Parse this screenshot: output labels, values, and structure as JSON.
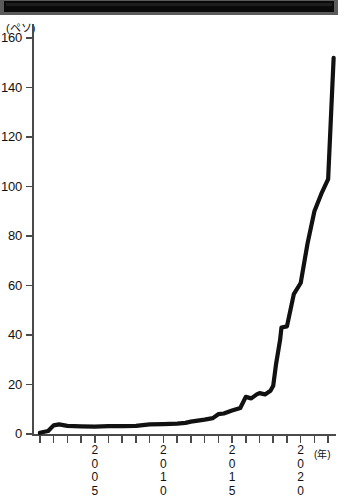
{
  "title_band": {
    "label": "redacted-title-bar",
    "text": ""
  },
  "chart_data": {
    "type": "line",
    "title": "",
    "xlabel": "(年)",
    "ylabel": "(ペソ)",
    "yunit": "(ペソ)",
    "xunit": "(年)",
    "ylim": [
      0,
      160
    ],
    "xlim": [
      2000.5,
      2022.5
    ],
    "grid": false,
    "legend": null,
    "y_ticks": [
      0,
      20,
      40,
      60,
      80,
      100,
      120,
      140,
      160
    ],
    "y_tick_labels": [
      "0",
      "20",
      "40",
      "60",
      "80",
      "100",
      "120",
      "140",
      "160"
    ],
    "x_ticks": [
      2001,
      2002,
      2003,
      2004,
      2005,
      2006,
      2007,
      2008,
      2009,
      2010,
      2011,
      2012,
      2013,
      2014,
      2015,
      2016,
      2017,
      2018,
      2019,
      2020,
      2021,
      2022
    ],
    "x_tick_labels": [
      "",
      "",
      "",
      "",
      "2005",
      "",
      "",
      "",
      "",
      "2010",
      "",
      "",
      "",
      "",
      "2015",
      "",
      "",
      "",
      "",
      "2020",
      "",
      ""
    ],
    "x_labeled_years": [
      "2005",
      "2010",
      "2015",
      "2020"
    ],
    "series": [
      {
        "name": "peso-rate",
        "x": [
          2001.0,
          2001.6,
          2002.0,
          2002.4,
          2003.0,
          2004.0,
          2005.0,
          2006.0,
          2007.0,
          2008.0,
          2009.0,
          2010.0,
          2011.0,
          2011.6,
          2012.0,
          2013.0,
          2013.6,
          2014.0,
          2014.4,
          2015.0,
          2015.6,
          2016.0,
          2016.4,
          2016.8,
          2017.0,
          2017.4,
          2017.8,
          2018.0,
          2018.2,
          2018.5,
          2018.6,
          2019.0,
          2019.5,
          2020.0,
          2020.5,
          2021.0,
          2021.5,
          2022.0,
          2022.4
        ],
        "values": [
          0.5,
          1.2,
          3.5,
          3.9,
          3.3,
          3.1,
          3.0,
          3.2,
          3.2,
          3.3,
          3.9,
          4.0,
          4.2,
          4.5,
          5.0,
          5.8,
          6.4,
          8.0,
          8.3,
          9.5,
          10.5,
          15.0,
          14.4,
          16.0,
          16.5,
          16.0,
          17.5,
          19.5,
          28.0,
          38.0,
          43.0,
          43.5,
          56.5,
          61.0,
          77.0,
          90.0,
          97.0,
          103.0,
          152.0
        ]
      }
    ],
    "line_color": "#111111",
    "line_width": 4.2,
    "final_value": 152,
    "start_value": 0.5
  }
}
